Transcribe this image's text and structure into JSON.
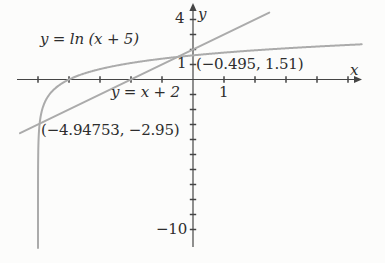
{
  "figure": {
    "background": "#fcfcfb",
    "text_color": "#2d2d2d"
  },
  "chart_data": {
    "type": "line",
    "title": "",
    "curves": [
      {
        "name": "log-curve",
        "label": "y = ln (x + 5)",
        "expression": "y = ln(x + 5)",
        "type": "ln",
        "shift": 5,
        "x_end": 5.45,
        "color": "#ababab",
        "stroke_width": 2
      },
      {
        "name": "line-curve",
        "label": "y = x + 2",
        "expression": "y = x + 2",
        "type": "linear",
        "slope": 1,
        "intercept": 2,
        "x_domain": [
          -5.58,
          2.46
        ],
        "color": "#ababab",
        "stroke_width": 2
      }
    ],
    "points": [
      {
        "name": "intersection-1",
        "x": -0.495,
        "y": 1.51,
        "label": "(−0.495, 1.51)"
      },
      {
        "name": "intersection-2",
        "x": -4.94753,
        "y": -2.95,
        "label": "(−4.94753, −2.95)"
      }
    ],
    "x_axis": {
      "label": "x",
      "ticks": [
        -5,
        -4,
        -3,
        -2,
        -1,
        1,
        2,
        3,
        4,
        5
      ],
      "labeled_ticks": [
        1
      ],
      "range_shown": [
        -5.7,
        5.5
      ]
    },
    "y_axis": {
      "label": "y",
      "ticks": [
        4,
        3,
        2,
        1,
        -1,
        -2,
        -3,
        -4,
        -5,
        -6,
        -7,
        -8,
        -9,
        -10
      ],
      "labeled_ticks": [
        4,
        1,
        -10
      ],
      "range_shown": [
        -11.2,
        5
      ]
    },
    "axis_tick_labels": {
      "y_four": "4",
      "y_one": "1",
      "x_one": "1",
      "y_neg_ten": "−10"
    },
    "plot": {
      "origin_px": [
        193,
        79.5
      ],
      "unit_px": [
        31,
        15
      ],
      "x_axis_px": [
        17,
        361
      ],
      "y_axis_px": [
        4,
        247
      ],
      "axis_color": "#454545",
      "axis_width": 1.2,
      "tick_half": 3.2,
      "curve_bottom_clip_px": 248
    }
  }
}
